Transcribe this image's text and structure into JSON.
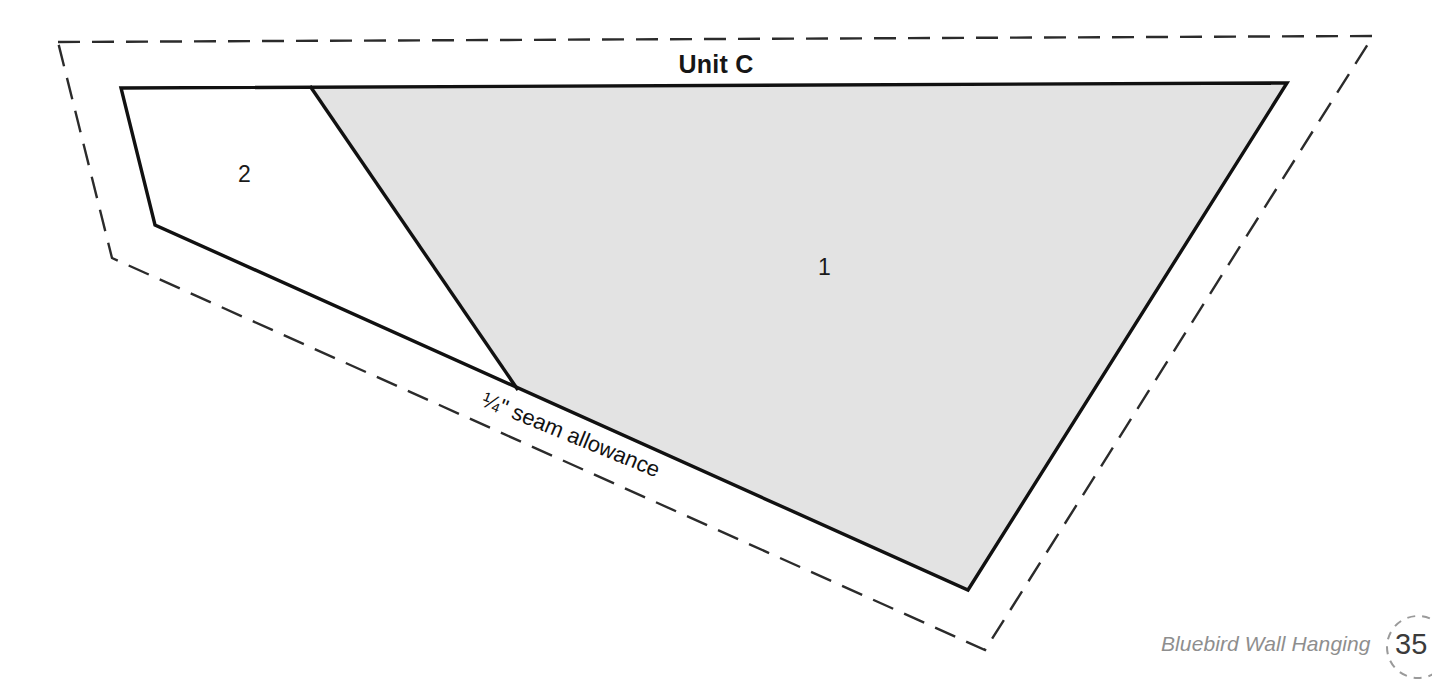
{
  "page": {
    "title": "Unit C",
    "background_color": "#ffffff"
  },
  "diagram": {
    "type": "foundation-paper-piecing-template",
    "unit_label": "Unit C",
    "seam_allowance_label": "¼\" seam allowance",
    "pieces": [
      {
        "number": "1",
        "fill": "#e3e3e3",
        "label_x": 826,
        "label_y": 268
      },
      {
        "number": "2",
        "fill": "#ffffff",
        "label_x": 247,
        "label_y": 175
      }
    ],
    "colors": {
      "stitch_line": "#111111",
      "cut_line_dashed": "#2b2b2b",
      "piece_1_fill": "#e3e3e3",
      "piece_2_fill": "#ffffff",
      "caption_gray": "#8e8e8e",
      "badge_gray": "#9a9a9a"
    },
    "cut_line_dash_pattern": "22 12",
    "outer_cut_outline": "58,42 1373,36 985,650 112,258",
    "sewing_outline": "121,88 1287,83 968,590 155,225",
    "piece_divider": "310,86 518,390"
  },
  "footer": {
    "project_name": "Bluebird Wall Hanging",
    "page_number": "35"
  },
  "icons": {
    "page-badge": "dashed-circle"
  }
}
